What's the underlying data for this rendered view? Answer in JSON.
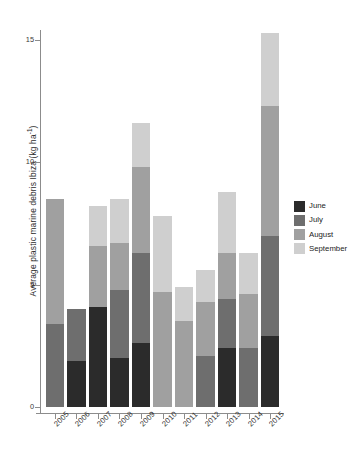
{
  "chart_data": {
    "type": "bar",
    "subtype": "stacked-bar",
    "title": "",
    "xlabel": "",
    "ylabel": "Average plastic marine debris Ibiza (kg ha-1)",
    "ylabel_parts": {
      "text": "Average plastic marine debris Ibiza (kg ha",
      "sup": "-1",
      "tail": ")"
    },
    "categories": [
      "2005",
      "2006",
      "2007",
      "2008",
      "2009",
      "2010",
      "2011",
      "2012",
      "2013",
      "2014",
      "2015"
    ],
    "series": [
      {
        "name": "June",
        "color": "#2b2b2b",
        "values": [
          0.0,
          1.9,
          4.1,
          2.0,
          2.6,
          0.0,
          0.0,
          0.0,
          2.4,
          0.0,
          2.9
        ]
      },
      {
        "name": "July",
        "color": "#6e6e6e",
        "values": [
          3.4,
          2.1,
          0.0,
          2.8,
          3.7,
          0.0,
          0.0,
          2.1,
          2.0,
          2.4,
          4.1
        ]
      },
      {
        "name": "August",
        "color": "#a0a0a0",
        "values": [
          5.1,
          0.0,
          2.5,
          1.9,
          3.5,
          4.7,
          3.5,
          2.2,
          1.9,
          2.2,
          5.3
        ]
      },
      {
        "name": "September",
        "color": "#cfcfcf",
        "values": [
          0.0,
          0.0,
          1.6,
          1.8,
          1.8,
          3.1,
          1.4,
          1.3,
          2.5,
          1.7,
          3.0
        ]
      }
    ],
    "totals": [
      8.5,
      4.0,
      8.2,
      8.5,
      11.6,
      7.8,
      4.9,
      5.6,
      8.8,
      6.3,
      15.3
    ],
    "ylim": [
      0,
      15.8
    ],
    "yticks": [
      0,
      5,
      10,
      15
    ],
    "ytick_labels": [
      "0",
      "5",
      "10",
      "15"
    ],
    "grid": false,
    "legend": {
      "position": "right",
      "entries": [
        "June",
        "July",
        "August",
        "September"
      ]
    },
    "axis_color": "#8c8c8c",
    "background": "#ffffff"
  }
}
